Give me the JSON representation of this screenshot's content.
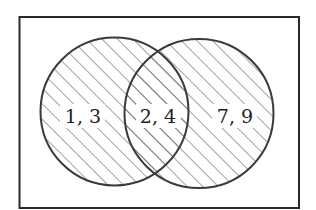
{
  "diagram": {
    "type": "venn",
    "universe": {
      "label": ""
    },
    "sets": [
      {
        "name": "left-set",
        "shaded": true
      },
      {
        "name": "right-set",
        "shaded": true
      }
    ],
    "regions": {
      "left_only": "1, 3",
      "intersection": "2, 4",
      "right_only": "7, 9"
    },
    "colors": {
      "stroke": "#3a3a3a",
      "hatch": "#555555",
      "background": "#ffffff"
    }
  }
}
